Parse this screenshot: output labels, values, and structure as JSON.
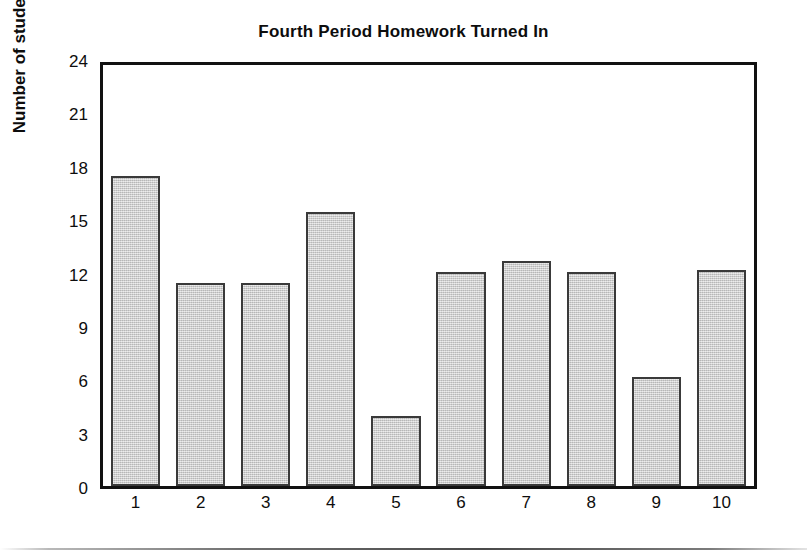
{
  "chart_data": {
    "type": "bar",
    "title": "Fourth Period Homework Turned In",
    "xlabel": "",
    "ylabel": "Number of students",
    "categories": [
      "1",
      "2",
      "3",
      "4",
      "5",
      "6",
      "7",
      "8",
      "9",
      "10"
    ],
    "values": [
      17.7,
      11.6,
      11.6,
      15.6,
      4.0,
      12.2,
      12.8,
      12.2,
      6.2,
      12.3
    ],
    "ylim": [
      0,
      24
    ],
    "yticks": [
      0,
      3,
      6,
      9,
      12,
      15,
      18,
      21,
      24
    ],
    "ytick_labels": [
      "0",
      "3",
      "6",
      "9",
      "12",
      "15",
      "18",
      "21",
      "24"
    ],
    "grid": false,
    "legend": null,
    "bar_color": "#c9c9c9",
    "bar_edge_color": "#3a3a3a",
    "axis_color": "#111111",
    "background": "#ffffff"
  },
  "figure": {
    "title": "Fourth Period Homework Turned In",
    "y_axis_title": "Number of students"
  }
}
